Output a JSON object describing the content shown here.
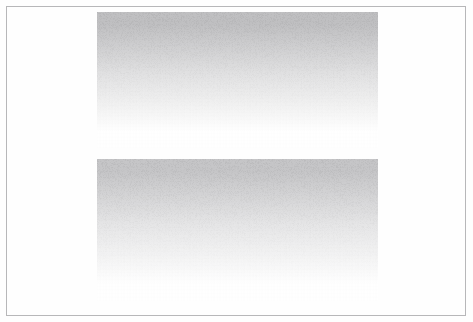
{
  "page": {
    "label": "Scanned document sheet",
    "width": 473,
    "height": 322,
    "background_color": "#ffffff",
    "content_text": ""
  },
  "frame": {
    "label": "Page border rule",
    "color": "#b7b7b9",
    "stroke_width": 1,
    "left": 6,
    "top": 6,
    "width": 460,
    "height": 310
  },
  "blocks": [
    {
      "name": "upper-gradient-block",
      "label": "Upper faded text block",
      "left": 97,
      "top": 12,
      "width": 281,
      "height": 136,
      "gradient_from": "#c0c0c2",
      "gradient_mid": "#e2e2e3",
      "gradient_to": "#ffffff",
      "content_text": ""
    },
    {
      "name": "lower-gradient-block",
      "label": "Lower faded text block",
      "left": 97,
      "top": 159,
      "width": 281,
      "height": 142,
      "gradient_from": "#c6c6c8",
      "gradient_mid": "#e6e6e7",
      "gradient_to": "#ffffff",
      "content_text": ""
    }
  ],
  "colors": {
    "paper": "#ffffff",
    "rule": "#b7b7b9",
    "ink_darkest": "#c0c0c2",
    "ink_faded": "#ffffff"
  }
}
